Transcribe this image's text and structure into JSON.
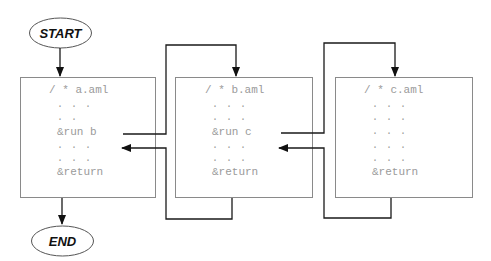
{
  "diagram": {
    "start_label": "START",
    "end_label": "END",
    "boxes": [
      {
        "name": "a.aml",
        "lines": [
          "/ * a.aml",
          ". . .",
          ". .",
          "&run b",
          ". . .",
          ". . .",
          "&return"
        ]
      },
      {
        "name": "b.aml",
        "lines": [
          "/ * b.aml",
          ". . .",
          ". . .",
          "&run c",
          ". . .",
          ". . .",
          "&return"
        ]
      },
      {
        "name": "c.aml",
        "lines": [
          "/ * c.aml",
          ". . .",
          ". . .",
          ". . .",
          ". . .",
          ". . .",
          "&return"
        ]
      }
    ],
    "colors": {
      "box_stroke": "#8a8a8a",
      "connector": "#1a1a1a",
      "code_text": "#9a9a9a",
      "terminal_text": "#111111"
    }
  }
}
